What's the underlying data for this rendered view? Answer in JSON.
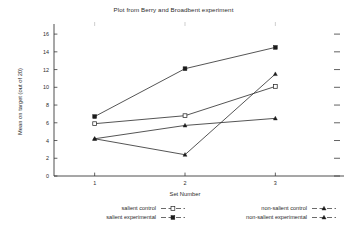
{
  "chart_data": {
    "type": "line",
    "title": "Plot from Berry and Broadbent experiment",
    "xlabel": "Set Number",
    "ylabel": "Mean on target (out of 20)",
    "x": [
      1,
      2,
      3
    ],
    "xticklabels": [
      "1",
      "2",
      "3"
    ],
    "yticks": [
      0,
      2,
      4,
      6,
      8,
      10,
      12,
      14,
      16
    ],
    "yticklabels": [
      "0",
      "2",
      "4",
      "6",
      "8",
      "10",
      "12",
      "14",
      "16"
    ],
    "xlim": [
      0.55,
      3.45
    ],
    "ylim": [
      0,
      16.8
    ],
    "grid": false,
    "legend_position": "below",
    "series": [
      {
        "name": "salient control",
        "marker": "open-square",
        "values": [
          5.9,
          6.8,
          10.1
        ]
      },
      {
        "name": "salient experimental",
        "marker": "filled-square",
        "values": [
          6.7,
          12.1,
          14.5
        ]
      },
      {
        "name": "non-salient control",
        "marker": "small-triangle",
        "values": [
          4.2,
          5.7,
          6.5
        ]
      },
      {
        "name": "non-salient experimental",
        "marker": "small-triangle",
        "values": [
          4.2,
          2.4,
          11.5
        ]
      }
    ]
  },
  "legend": {
    "entries": [
      {
        "label": "salient control",
        "marker": "open-square"
      },
      {
        "label": "salient experimental",
        "marker": "filled-square"
      },
      {
        "label": "non-salient control",
        "marker": "small-triangle"
      },
      {
        "label": "non-salient experimental",
        "marker": "small-triangle"
      }
    ]
  }
}
